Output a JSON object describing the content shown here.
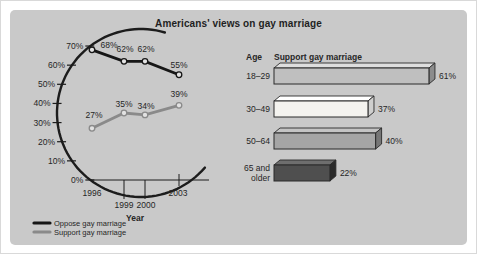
{
  "title": "Americans' views on gay marriage",
  "colors": {
    "page_bg": "#ffffff",
    "panel_bg": "#c9c9c9",
    "text": "#262626",
    "axis": "#1c1c1c",
    "outline": "#2a2a2a",
    "oppose_line": "#161616",
    "support_line": "#8a8a8a",
    "marker_fill": "#e2e2e2"
  },
  "chart_data": [
    {
      "type": "line",
      "title": "Americans' views on gay marriage",
      "xlabel": "Year",
      "x_labels": [
        "1996",
        "1999",
        "2000",
        "2003"
      ],
      "y_ticks": [
        "70%",
        "60%",
        "50%",
        "40%",
        "30%",
        "20%",
        "10%",
        "0%"
      ],
      "ylim": [
        0,
        70
      ],
      "axis_style": "curved swoosh y-axis",
      "legend_position": "bottom-left",
      "series": [
        {
          "name": "Oppose gay marriage",
          "color": "#161616",
          "values": [
            68,
            62,
            62,
            55
          ],
          "point_labels": [
            "68%",
            "62%",
            "62%",
            "55%"
          ]
        },
        {
          "name": "Support gay marriage",
          "color": "#8a8a8a",
          "values": [
            27,
            35,
            34,
            39
          ],
          "point_labels": [
            "27%",
            "35%",
            "34%",
            "39%"
          ]
        }
      ]
    },
    {
      "type": "bar",
      "orientation": "horizontal",
      "col_headers": [
        "Age",
        "Support gay marriage"
      ],
      "categories": [
        "18–29",
        "30–49",
        "50–64",
        "65 and older"
      ],
      "category_lines": [
        [
          "18–29"
        ],
        [
          "30–49"
        ],
        [
          "50–64"
        ],
        [
          "65 and",
          "older"
        ]
      ],
      "values": [
        61,
        37,
        40,
        22
      ],
      "value_labels": [
        "61%",
        "37%",
        "40%",
        "22%"
      ],
      "xlim": [
        0,
        70
      ],
      "bar_front_colors": [
        "#bfbfbf",
        "#f4f3ef",
        "#a5a5a5",
        "#4f4f4f"
      ],
      "bar_top_colors": [
        "#dedede",
        "#ffffff",
        "#c4c4c4",
        "#6e6e6e"
      ],
      "bar_side_colors": [
        "#8c8c8c",
        "#cfcfce",
        "#767676",
        "#2b2b2b"
      ]
    }
  ]
}
